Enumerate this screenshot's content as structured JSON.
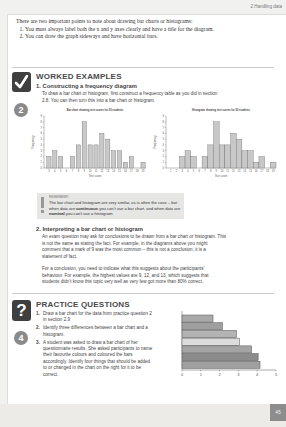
{
  "header": {
    "chapter": "2  Handling data"
  },
  "intro": {
    "lead": "There are two important points to note about drawing bar charts or histograms:",
    "points": [
      "You must always label both the x and y axes clearly and have a title for the diagram.",
      "You can draw the graph sideways and have horizontal bars."
    ]
  },
  "worked_examples": {
    "title": "WORKED EXAMPLES",
    "badge_icon": "checkmark-icon",
    "step_number": "2",
    "example1": {
      "title": "1. Constructing a frequency diagram",
      "text": "To draw a bar chart or histogram, first construct a frequency table as you did in section 2.8. You can then turn this into a bar chart or histogram."
    },
    "remember": {
      "label": "REMEMBER!",
      "text_before": "The bar chart and histogram are very similar, as is often the case – but when data are ",
      "bold1": "continuous",
      "text_mid": " you can't use a bar chart, and when data are ",
      "bold2": "nominal",
      "text_after": " you can't use a histogram."
    },
    "example2": {
      "title": "2. Interpreting a bar chart or histogram",
      "para1": "An exam question may ask for conclusions to be drawn from a bar chart or histogram. This is not the same as stating the fact. For example, in the diagrams above you might comment that a mark of 9 was the most common – this is not a conclusion, it is a statement of fact.",
      "para2": "For a conclusion, you need to indicate what this suggests about the participants' behaviour. For example, the highest values are 9, 12, and 13, which suggests that students didn't know this topic very well as very few got more than 80% correct."
    }
  },
  "practice_questions": {
    "title": "PRACTICE QUESTIONS",
    "badge_icon": "question-mark-icon",
    "step_number": "4",
    "items": [
      {
        "n": "1.",
        "text": "Draw a bar chart for the data from practice question 2 in section 2.9"
      },
      {
        "n": "2.",
        "text": "Identify three differences between a bar chart and a histogram."
      },
      {
        "n": "3.",
        "text": "A student was asked to draw a bar chart of her questionnaire results. She asked participants to name their favourite colours and coloured the bars accordingly. Identify four things that should be added to or changed in the chart on the right for it to be correct."
      }
    ]
  },
  "footer": {
    "page_number": "45"
  },
  "chart_data": [
    {
      "type": "bar",
      "title": "Bar chart showing test scores for 50 students",
      "xlabel": "Test score",
      "ylabel": "Frequency",
      "categories": [
        3,
        4,
        5,
        6,
        7,
        8,
        9,
        10,
        11,
        12,
        13,
        14,
        15,
        16,
        17,
        18,
        19
      ],
      "values": [
        2,
        3,
        2,
        0,
        2,
        4,
        8,
        4,
        4,
        6,
        5,
        3,
        3,
        1,
        2,
        0,
        1
      ],
      "ylim": [
        0,
        9
      ],
      "grid": false,
      "bar_gap": true
    },
    {
      "type": "bar",
      "title": "Histogram showing test scores for 50 students",
      "xlabel": "Test score",
      "ylabel": "Frequency",
      "categories": [
        1,
        2,
        3,
        4,
        5,
        6,
        7,
        8,
        9,
        10,
        11,
        12,
        13,
        14,
        15,
        16,
        17,
        18,
        19
      ],
      "values": [
        0,
        0,
        2,
        3,
        2,
        0,
        2,
        4,
        8,
        4,
        4,
        6,
        5,
        3,
        3,
        1,
        2,
        0,
        1
      ],
      "ylim": [
        0,
        9
      ],
      "grid": false,
      "bar_gap": false
    },
    {
      "type": "bar",
      "orientation": "horizontal",
      "title": "",
      "xlabel": "",
      "ylabel": "",
      "values": [
        1.65,
        2.15,
        2.9,
        3.05,
        3.7,
        4.05,
        4.15
      ],
      "bar_colors": [
        "#a9a9a9",
        "#9f9f9f",
        "#b3b3b3",
        "#dcdcdc",
        "#a4a4a4",
        "#8c8c8c",
        "#a0a0a0"
      ],
      "xticks": [
        0,
        1,
        2,
        3,
        4,
        5
      ],
      "xlim": [
        0,
        5
      ]
    }
  ]
}
